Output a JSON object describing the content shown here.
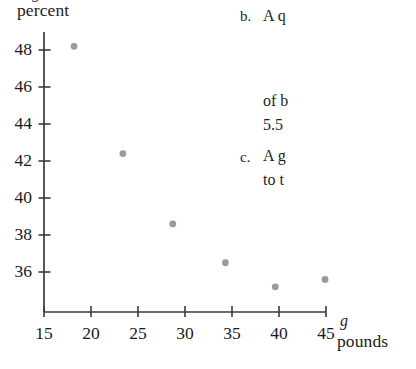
{
  "chart_data": {
    "type": "scatter",
    "title": "",
    "ylabel": "percent",
    "xlabel": "pounds",
    "x_variable": "g",
    "y_variable_clipped": "g",
    "xlim": [
      15,
      46
    ],
    "ylim": [
      34.6,
      49.2
    ],
    "xticks": [
      15,
      20,
      25,
      30,
      35,
      40,
      45
    ],
    "xtick_labels": [
      "15",
      "20",
      "25",
      "30",
      "35",
      "40",
      "45"
    ],
    "yticks": [
      36,
      38,
      40,
      42,
      44,
      46,
      48
    ],
    "ytick_labels": [
      "36",
      "38",
      "40",
      "42",
      "44",
      "46",
      "48"
    ],
    "grid": false,
    "legend": null,
    "point_color": "#9a9a9a",
    "axis_color": "#3c3a3a",
    "points": [
      {
        "x": 18.2,
        "y": 48.2
      },
      {
        "x": 23.4,
        "y": 42.4
      },
      {
        "x": 28.7,
        "y": 38.6
      },
      {
        "x": 34.3,
        "y": 36.5
      },
      {
        "x": 39.6,
        "y": 35.2
      },
      {
        "x": 44.9,
        "y": 35.6
      }
    ],
    "series": [
      {
        "name": "",
        "x": [
          18.2,
          23.4,
          28.7,
          34.3,
          39.6,
          44.9
        ],
        "values": [
          48.2,
          42.4,
          38.6,
          36.5,
          35.2,
          35.6
        ]
      }
    ]
  },
  "text_column": {
    "items": [
      {
        "marker": "b.",
        "lines": [
          "A q"
        ]
      },
      {
        "marker": "",
        "lines": [
          "of b",
          "5.5"
        ]
      },
      {
        "marker": "c.",
        "lines": [
          "A g",
          "to t"
        ]
      }
    ],
    "item_b_marker": "b.",
    "item_b_line1": "A q",
    "item_b_line2": "of b",
    "item_b_line3": "5.5",
    "item_c_marker": "c.",
    "item_c_line1": "A g",
    "item_c_line2": "to t"
  }
}
